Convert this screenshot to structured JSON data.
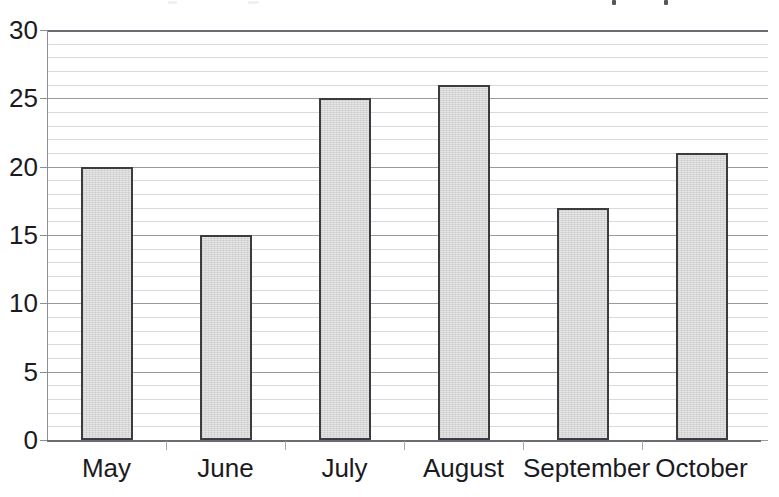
{
  "chart_data": {
    "type": "bar",
    "title": "",
    "xlabel": "",
    "ylabel": "",
    "categories": [
      "May",
      "June",
      "July",
      "August",
      "September",
      "October"
    ],
    "values": [
      20,
      15,
      25,
      26,
      17,
      21
    ],
    "ylim": [
      0,
      30
    ],
    "ytick_labels": [
      "30",
      "25",
      "20",
      "15",
      "10",
      "5",
      "0"
    ],
    "ytick_values": [
      30,
      25,
      20,
      15,
      10,
      5,
      0
    ],
    "minor_gridline_step": 1,
    "grid": true,
    "legend": false,
    "legend_position": "none",
    "bar_fill_color": "#d3d3d3",
    "bar_border_color": "#3b3b40",
    "gridline_color": "#d9d9dd",
    "axis_color": "#6b6b72",
    "text_color": "#1b1b1f"
  },
  "axis": {
    "y_labels": [
      "30",
      "25",
      "20",
      "15",
      "10",
      "5",
      "0"
    ],
    "x_labels": [
      "May",
      "June",
      "July",
      "August",
      "September",
      "October"
    ]
  }
}
